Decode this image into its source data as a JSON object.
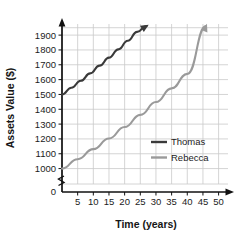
{
  "chart_data": {
    "type": "line",
    "title": "",
    "xlabel": "Time (years)",
    "ylabel": "Assets Value ($)",
    "xlim": [
      0,
      53
    ],
    "ylim": [
      950,
      1975
    ],
    "grid": true,
    "axis_break": true,
    "axis_break_note": "y-axis broken between 0 and 1000",
    "legend_position": "inside-right",
    "xticks": [
      5,
      10,
      15,
      20,
      25,
      30,
      35,
      40,
      45,
      50
    ],
    "yticks": [
      0,
      1000,
      1100,
      1200,
      1300,
      1400,
      1500,
      1600,
      1700,
      1800,
      1900
    ],
    "series": [
      {
        "name": "Thomas",
        "color": "#3a3a3a",
        "arrow_end": true,
        "x": [
          0,
          3,
          6,
          9,
          12,
          15,
          18,
          21,
          24,
          27
        ],
        "values": [
          1500,
          1545,
          1592,
          1642,
          1694,
          1748,
          1804,
          1862,
          1922,
          1985
        ]
      },
      {
        "name": "Rebecca",
        "color": "#9a9a9a",
        "arrow_end": true,
        "x": [
          0,
          5,
          10,
          15,
          20,
          25,
          30,
          35,
          40,
          46
        ],
        "values": [
          1000,
          1063,
          1131,
          1203,
          1280,
          1362,
          1449,
          1541,
          1639,
          1970
        ]
      }
    ]
  },
  "axes": {
    "x_title": "Time (years)",
    "y_title": "Assets Value ($)",
    "x_tick_labels": [
      "5",
      "10",
      "15",
      "20",
      "25",
      "30",
      "35",
      "40",
      "45",
      "50"
    ],
    "y_tick_labels": [
      "1900",
      "1800",
      "1700",
      "1600",
      "1500",
      "1400",
      "1300",
      "1200",
      "1100",
      "1000",
      "0"
    ]
  },
  "legend": {
    "entries": [
      {
        "label": "Thomas",
        "color": "#3a3a3a"
      },
      {
        "label": "Rebecca",
        "color": "#9a9a9a"
      }
    ]
  },
  "colors": {
    "grid": "#c9c9c9",
    "axis": "#111111",
    "thomas": "#3a3a3a",
    "rebecca": "#9a9a9a",
    "text": "#1b1b1b",
    "background": "#ffffff"
  }
}
